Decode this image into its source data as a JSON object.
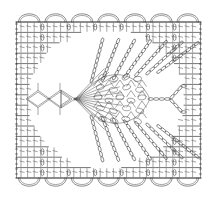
{
  "document": {
    "title": "Crochet Stitch Chart",
    "type": "crochet-pattern-diagram",
    "description": "Rectangular crochet chart with central leaf motif, radiating chain loops and scalloped picot border"
  },
  "canvas": {
    "width": 217,
    "height": 198,
    "background_color": "#ffffff",
    "ink_color": "#3a3a3a"
  },
  "chart_data": {
    "type": "diagram",
    "grid": {
      "left": 16,
      "right": 201,
      "top": 22,
      "bottom": 178,
      "columns": 7,
      "rows": 15
    },
    "borders": {
      "top_scallops": 7,
      "bottom_scallops": 7,
      "left_chain_column": true,
      "right_chain_column": true,
      "scallop_width": 26,
      "scallop_height": 11
    },
    "stitch_rows": {
      "count": 15,
      "spacing": 10.4,
      "symbol": "double-crochet",
      "bar_count_per_cell": 3
    },
    "center_motif": {
      "name": "leaf-pinecone-fan",
      "center_x": 120,
      "center_y": 99,
      "apex_x": 75,
      "apex_y": 99,
      "mesh_rows": 5,
      "mesh_columns": 5,
      "body_width": 52,
      "body_height": 56
    },
    "radiating_loops": {
      "upper_count": 7,
      "lower_count": 7,
      "loop_style": "chain-stitch-oval-strand"
    },
    "left_diamonds": {
      "count": 2,
      "center_y": 99,
      "positions_x": [
        38,
        60
      ],
      "size": 12
    }
  }
}
